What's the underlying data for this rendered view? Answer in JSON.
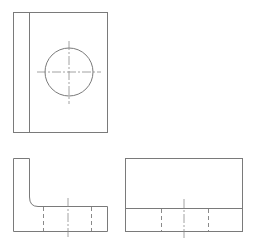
{
  "drawing": {
    "type": "orthographic-projection",
    "background": "#ffffff",
    "line_color": "#7a7a7a",
    "views": [
      {
        "name": "top-view",
        "outline": {
          "x": 13,
          "y": 12,
          "w": 95,
          "h": 121
        },
        "inner_edge_x": 29,
        "hole": {
          "cx": 69,
          "cy": 72,
          "r": 24
        },
        "centerlines": [
          {
            "x1": 37,
            "y1": 72,
            "x2": 101,
            "y2": 72
          },
          {
            "x1": 69,
            "y1": 41,
            "x2": 69,
            "y2": 104
          }
        ]
      },
      {
        "name": "front-view",
        "shape": "L-bracket",
        "points": "13,158 29,158 29,197 Q 29,206 38,206 107,206 107,231 13,231",
        "hidden_lines_x": [
          43,
          91
        ],
        "hidden_y_range": [
          206,
          231
        ],
        "centerline": {
          "x": 68,
          "y1": 198,
          "y2": 239
        }
      },
      {
        "name": "side-view",
        "outline": {
          "x": 125,
          "y": 158,
          "w": 118,
          "h": 73
        },
        "step_line_y": 208,
        "hidden_lines_x": [
          161,
          208
        ],
        "hidden_y_range": [
          208,
          231
        ],
        "centerline": {
          "x": 184,
          "y1": 199,
          "y2": 239
        }
      }
    ]
  }
}
